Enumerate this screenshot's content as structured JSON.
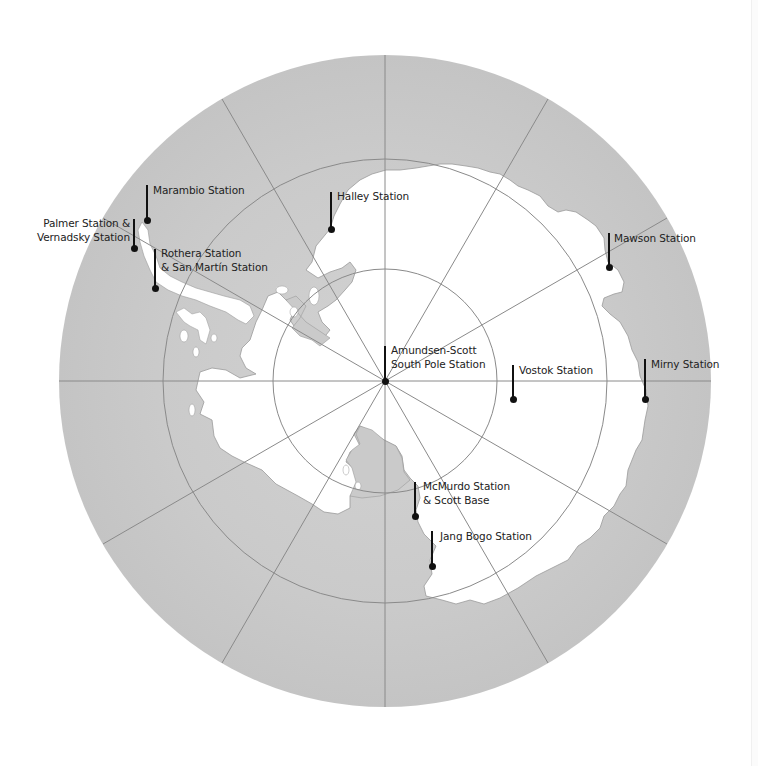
{
  "map": {
    "title": "Antarctic research stations",
    "projection": "south polar stereographic",
    "colors": {
      "ocean": "#c9c9c9",
      "ocean_light": "#d8d8d8",
      "land": "#ffffff",
      "graticule": "#8a8a8a",
      "pin": "#111111",
      "text": "#222222",
      "background": "#ffffff"
    },
    "center": {
      "x": 385,
      "y": 381
    },
    "outer_radius": 326,
    "latitude_circles_radii": [
      112,
      222
    ],
    "meridian_count": 12
  },
  "stations": [
    {
      "id": "marambio",
      "label": "Marambio Station",
      "line_x": 147,
      "line_top": 185,
      "dot_y": 220,
      "label_x": 153,
      "label_y": 183,
      "align": "left"
    },
    {
      "id": "palmer-vernadsky",
      "label": "Palmer Station &\nVernadsky Station",
      "line_x": 134,
      "line_top": 219,
      "dot_y": 248,
      "label_x": 28,
      "label_y": 216,
      "align": "right"
    },
    {
      "id": "rothera-san-martin",
      "label": "Rothera Station\n& San Martín Station",
      "line_x": 155,
      "line_top": 249,
      "dot_y": 288,
      "label_x": 161,
      "label_y": 246,
      "align": "left"
    },
    {
      "id": "halley",
      "label": "Halley Station",
      "line_x": 331,
      "line_top": 192,
      "dot_y": 229,
      "label_x": 337,
      "label_y": 189,
      "align": "left"
    },
    {
      "id": "mawson",
      "label": "Mawson Station",
      "line_x": 609,
      "line_top": 233,
      "dot_y": 267,
      "label_x": 614,
      "label_y": 231,
      "align": "left"
    },
    {
      "id": "amundsen-scott",
      "label": "Amundsen-Scott\nSouth Pole Station",
      "line_x": 385,
      "line_top": 346,
      "dot_y": 381,
      "label_x": 391,
      "label_y": 343,
      "align": "left"
    },
    {
      "id": "vostok",
      "label": "Vostok Station",
      "line_x": 513,
      "line_top": 365,
      "dot_y": 399,
      "label_x": 519,
      "label_y": 363,
      "align": "left"
    },
    {
      "id": "mirny",
      "label": "Mirny Station",
      "line_x": 645,
      "line_top": 359,
      "dot_y": 399,
      "label_x": 651,
      "label_y": 357,
      "align": "left"
    },
    {
      "id": "mcmurdo-scott",
      "label": "McMurdo Station\n& Scott Base",
      "line_x": 415,
      "line_top": 482,
      "dot_y": 516,
      "label_x": 423,
      "label_y": 479,
      "align": "left"
    },
    {
      "id": "jang-bogo",
      "label": "Jang Bogo Station",
      "line_x": 432,
      "line_top": 531,
      "dot_y": 566,
      "label_x": 440,
      "label_y": 529,
      "align": "left"
    }
  ]
}
